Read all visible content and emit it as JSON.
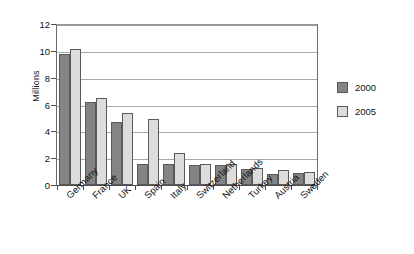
{
  "chart_data": {
    "type": "bar",
    "title": "",
    "xlabel": "",
    "ylabel": "Millions",
    "ylim": [
      0,
      12
    ],
    "yticks": [
      0,
      2,
      4,
      6,
      8,
      10,
      12
    ],
    "grid": true,
    "legend_position": "right",
    "categories": [
      "Germany",
      "France",
      "UK",
      "Spain",
      "Italy",
      "Switzerland",
      "Netherlands",
      "Turkey",
      "Austria",
      "Sweden"
    ],
    "series": [
      {
        "name": "2000",
        "color": "#848484",
        "values": [
          9.8,
          6.2,
          4.7,
          1.6,
          1.6,
          1.5,
          1.5,
          1.2,
          0.8,
          0.9
        ]
      },
      {
        "name": "2005",
        "color": "#dcdcdc",
        "values": [
          10.15,
          6.5,
          5.4,
          4.95,
          2.35,
          1.6,
          1.6,
          1.25,
          1.1,
          1.0
        ]
      }
    ]
  },
  "legend": {
    "items": [
      {
        "label": "2000"
      },
      {
        "label": "2005"
      }
    ]
  }
}
